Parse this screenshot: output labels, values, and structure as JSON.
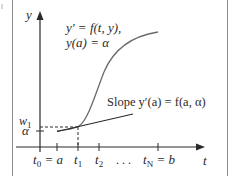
{
  "diagram": {
    "type": "euler-method-illustration",
    "axes": {
      "x_label": "t",
      "y_label": "y"
    },
    "equation": {
      "line1": "y′ = f(t, y),",
      "line2": "y(a) = α"
    },
    "slope_label": "Slope y′(a) = f(a, α)",
    "y_ticks": [
      {
        "label": "w",
        "subscript": "1"
      },
      {
        "label": "α"
      }
    ],
    "x_ticks": [
      {
        "label": "t",
        "subscript": "0",
        "suffix": " = a"
      },
      {
        "label": "t",
        "subscript": "1",
        "suffix": ""
      },
      {
        "label": "t",
        "subscript": "2",
        "suffix": ""
      },
      {
        "label": ". . .",
        "subscript": "",
        "suffix": ""
      },
      {
        "label": "t",
        "subscript": "N",
        "suffix": " = b"
      }
    ],
    "colors": {
      "line": "#2a2a2a",
      "curve": "#6a6a6a",
      "frame": "#8a8a8a",
      "background": "#ffffff"
    }
  }
}
